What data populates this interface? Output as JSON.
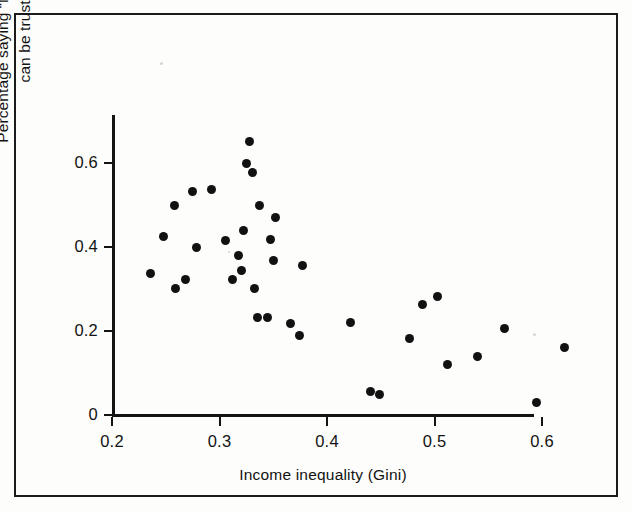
{
  "figure": {
    "background_color": "#fdfdfc",
    "frame_color": "#1b1b1b",
    "marker_color": "#111111",
    "axis_color": "#141414"
  },
  "chart_data": {
    "type": "scatter",
    "title": "",
    "xlabel": "Income inequality (Gini)",
    "ylabel": "Percentage saying \"Most people can be trusted\"",
    "ylabel_line1": "Percentage saying “Most people",
    "ylabel_line2": "can be trusted”",
    "xlim": [
      0.2,
      0.645
    ],
    "ylim": [
      0.0,
      0.715
    ],
    "xticks": [
      0.2,
      0.3,
      0.4,
      0.5,
      0.6
    ],
    "xticklabels": [
      "0.2",
      "0.3",
      "0.4",
      "0.5",
      "0.6"
    ],
    "yticks": [
      0,
      0.2,
      0.4,
      0.6
    ],
    "yticklabels": [
      "0",
      "0.2",
      "0.4",
      "0.6"
    ],
    "grid": false,
    "legend": "none",
    "marker": "filled-circle",
    "points": [
      {
        "x": 0.236,
        "y": 0.338
      },
      {
        "x": 0.248,
        "y": 0.425
      },
      {
        "x": 0.258,
        "y": 0.498
      },
      {
        "x": 0.259,
        "y": 0.302
      },
      {
        "x": 0.268,
        "y": 0.322
      },
      {
        "x": 0.275,
        "y": 0.532
      },
      {
        "x": 0.279,
        "y": 0.4
      },
      {
        "x": 0.293,
        "y": 0.536
      },
      {
        "x": 0.306,
        "y": 0.416
      },
      {
        "x": 0.312,
        "y": 0.322
      },
      {
        "x": 0.318,
        "y": 0.379
      },
      {
        "x": 0.32,
        "y": 0.345
      },
      {
        "x": 0.322,
        "y": 0.44
      },
      {
        "x": 0.325,
        "y": 0.6
      },
      {
        "x": 0.328,
        "y": 0.651
      },
      {
        "x": 0.331,
        "y": 0.578
      },
      {
        "x": 0.333,
        "y": 0.302
      },
      {
        "x": 0.335,
        "y": 0.233
      },
      {
        "x": 0.337,
        "y": 0.5
      },
      {
        "x": 0.345,
        "y": 0.233
      },
      {
        "x": 0.347,
        "y": 0.418
      },
      {
        "x": 0.35,
        "y": 0.369
      },
      {
        "x": 0.352,
        "y": 0.471
      },
      {
        "x": 0.366,
        "y": 0.219
      },
      {
        "x": 0.374,
        "y": 0.19
      },
      {
        "x": 0.377,
        "y": 0.357
      },
      {
        "x": 0.422,
        "y": 0.221
      },
      {
        "x": 0.44,
        "y": 0.057
      },
      {
        "x": 0.449,
        "y": 0.05
      },
      {
        "x": 0.477,
        "y": 0.181
      },
      {
        "x": 0.489,
        "y": 0.262
      },
      {
        "x": 0.503,
        "y": 0.283
      },
      {
        "x": 0.512,
        "y": 0.121
      },
      {
        "x": 0.54,
        "y": 0.14
      },
      {
        "x": 0.565,
        "y": 0.207
      },
      {
        "x": 0.595,
        "y": 0.029
      },
      {
        "x": 0.621,
        "y": 0.16
      }
    ]
  }
}
